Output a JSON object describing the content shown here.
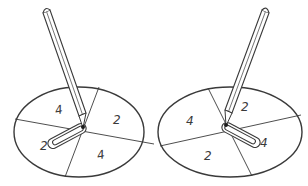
{
  "figure": {
    "spinners": [
      {
        "id": "left",
        "sections": [
          {
            "label": "4",
            "position": "top-left"
          },
          {
            "label": "2",
            "position": "right"
          },
          {
            "label": "4",
            "position": "bottom"
          },
          {
            "label": "2",
            "position": "left"
          }
        ]
      },
      {
        "id": "right",
        "sections": [
          {
            "label": "4",
            "position": "left"
          },
          {
            "label": "2",
            "position": "top"
          },
          {
            "label": "4",
            "position": "right"
          },
          {
            "label": "2",
            "position": "bottom"
          }
        ]
      }
    ],
    "colors": {
      "stroke": "#3a3a3a",
      "background": "#ffffff"
    }
  }
}
